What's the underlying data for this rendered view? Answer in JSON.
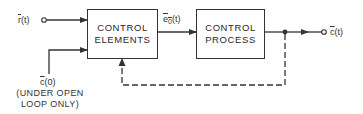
{
  "diagram": {
    "blocks": [
      {
        "id": "control-elements",
        "line1": "CONTROL",
        "line2": "ELEMENTS"
      },
      {
        "id": "control-process",
        "line1": "CONTROL",
        "line2": "PROCESS"
      }
    ],
    "signals": {
      "reference_input": {
        "symbol": "r",
        "arg": "(t)"
      },
      "actuating_signal": {
        "symbol": "e",
        "sub": "0",
        "arg": "(t)"
      },
      "output": {
        "symbol": "c",
        "arg": "(t)"
      },
      "initial_condition": {
        "symbol": "c",
        "arg": "(0)"
      }
    },
    "note": {
      "line1": "(UNDER OPEN",
      "line2": "LOOP ONLY)"
    },
    "feedback": {
      "style": "dashed"
    },
    "colors": {
      "line": "#333333",
      "background": "#ffffff"
    }
  }
}
